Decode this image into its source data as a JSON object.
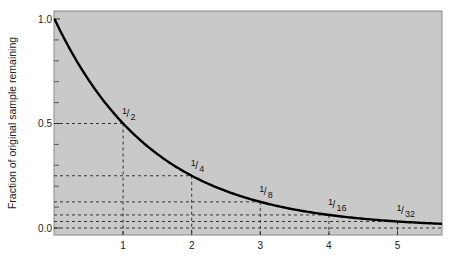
{
  "chart_data": {
    "type": "line",
    "title": "",
    "xlabel": "",
    "ylabel": "Fraction of original sample remaining",
    "xlim": [
      0,
      5.65
    ],
    "ylim": [
      0.0,
      1.0
    ],
    "x_ticks": [
      "1",
      "2",
      "3",
      "4",
      "5"
    ],
    "y_ticks": [
      "0.0",
      "0.5",
      "1.0"
    ],
    "y_minor_ticks": [
      0.1,
      0.2,
      0.3,
      0.4,
      0.6,
      0.7,
      0.8,
      0.9
    ],
    "grid": false,
    "background": "#c8c8c8",
    "series": [
      {
        "name": "Exponential decay (half-lives)",
        "function": "y = 0.5^x",
        "x": [
          0,
          1,
          2,
          3,
          4,
          5,
          5.65
        ],
        "values": [
          1.0,
          0.5,
          0.25,
          0.125,
          0.0625,
          0.03125,
          0.0199
        ],
        "color": "#000000"
      }
    ],
    "annotations": [
      {
        "x": 1,
        "y": 0.5,
        "label": "1/2",
        "numerator": "1",
        "denominator": "2"
      },
      {
        "x": 2,
        "y": 0.25,
        "label": "1/4",
        "numerator": "1",
        "denominator": "4"
      },
      {
        "x": 3,
        "y": 0.125,
        "label": "1/8",
        "numerator": "1",
        "denominator": "8"
      },
      {
        "x": 4,
        "y": 0.0625,
        "label": "1/16",
        "numerator": "1",
        "denominator": "16"
      },
      {
        "x": 5,
        "y": 0.03125,
        "label": "1/32",
        "numerator": "1",
        "denominator": "32"
      }
    ],
    "reference_lines": "dashed drop lines from each annotated point to both axes"
  }
}
